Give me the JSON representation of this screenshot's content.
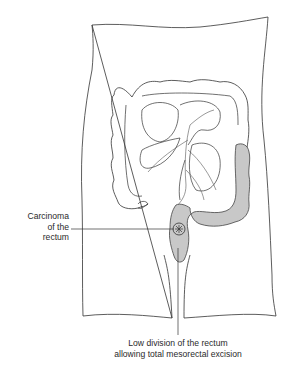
{
  "figure": {
    "highlight_color": "#c8c8c8",
    "line_color": "#333333",
    "labels": {
      "carcinoma": [
        "Carcinoma",
        "of the",
        "rectum"
      ],
      "division": [
        "Low division of the rectum",
        "allowing total mesorectal excision"
      ]
    }
  }
}
